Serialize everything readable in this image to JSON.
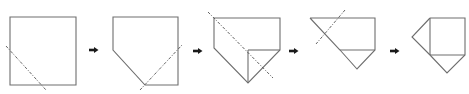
{
  "diagram": {
    "title": "Paper folding sequence",
    "step_count": 5,
    "colors": {
      "outline": "#6e6e6e",
      "fold_line": "#555555",
      "arrow": "#1a1a1a",
      "background": "#ffffff"
    },
    "steps": [
      {
        "label": "Step 1: square sheet with diagonal fold line at lower-left corner",
        "shape": "square",
        "outline": "10,17 76,17 76,85 10,85",
        "inner_lines": [],
        "fold_line": "6,46 46,90"
      },
      {
        "label": "Step 2: lower-left corner folded back; fold line at lower-right corner",
        "shape": "pentagon",
        "outline": "113,17 178,17 178,85 145,85 113,50",
        "inner_lines": [],
        "fold_line": "140,90 182,45"
      },
      {
        "label": "Step 3: lower-right corner folded up; fold line along long diagonal",
        "shape": "pentagon-with-flap",
        "outline": "214,18 280,18 280,50 248,83 214,48",
        "inner_lines": [
          "248,50 280,50",
          "248,50 248,83"
        ],
        "fold_line": "208,12 273,78"
      },
      {
        "label": "Step 4: folded along diagonal; fold line at upper-left tip",
        "shape": "folded-triangle",
        "outline": "310,18 375,18 375,50 357,69 340,50 310,18",
        "inner_lines": [
          "340,50 375,50"
        ],
        "fold_line": "345,10 316,44"
      },
      {
        "label": "Step 5: final shape — square with two triangular flaps",
        "shape": "square-with-flaps",
        "outline": "430,18 465,18 465,55 447,73 430,55 412,37 430,18",
        "inner_lines": [
          "430,18 430,55",
          "430,55 465,55"
        ],
        "fold_line": ""
      }
    ],
    "arrows": [
      {
        "x": 89,
        "y": 50,
        "direction": "right-arrow"
      },
      {
        "x": 193,
        "y": 51,
        "direction": "right-arrow"
      },
      {
        "x": 289,
        "y": 51,
        "direction": "right-arrow"
      },
      {
        "x": 390,
        "y": 51,
        "direction": "right-arrow"
      }
    ]
  }
}
